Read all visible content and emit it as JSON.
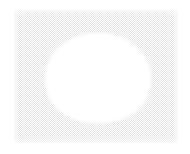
{
  "image": {
    "width": 190,
    "height": 154,
    "background_color": "#ffffff",
    "description": "A light grey finely-dithered rectangular panel on a white page, with a large soft-edged white rounded blob centered within it.",
    "alt_text": "Light grey halftone-textured rectangle containing a large white rounded shape"
  },
  "panel": {
    "name": "texture-panel",
    "fill_color": "#e3e3e3",
    "pattern": "checkerboard-dither",
    "pattern_size_px": 2,
    "x": 14,
    "y": 10,
    "width": 164,
    "height": 133,
    "label": ""
  },
  "blob": {
    "name": "white-blob",
    "fill_color": "#ffffff",
    "shape": "rounded-superellipse",
    "x": 48,
    "y": 36,
    "width": 100,
    "height": 84,
    "label": ""
  },
  "margin": {
    "color": "#ffffff",
    "left": 14,
    "top": 10,
    "right": 12,
    "bottom": 11
  }
}
